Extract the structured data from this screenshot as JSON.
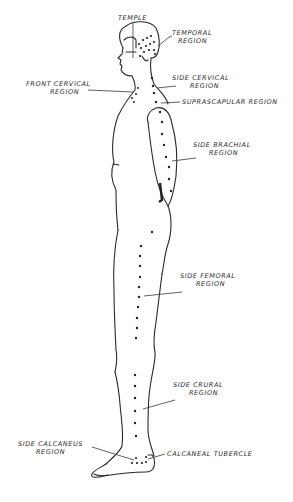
{
  "diagram": {
    "type": "anatomical side-view figure",
    "labels": {
      "temple": {
        "line1": "Temple",
        "line2": ""
      },
      "temporal": {
        "line1": "Temporal",
        "line2": "Region"
      },
      "front_cervical": {
        "line1": "Front Cervical",
        "line2": "Region"
      },
      "side_cervical": {
        "line1": "Side Cervical",
        "line2": "Region"
      },
      "suprascapular": {
        "line1": "Suprascapular Region",
        "line2": ""
      },
      "side_brachial": {
        "line1": "Side Brachial",
        "line2": "Region"
      },
      "side_femoral": {
        "line1": "Side Femoral",
        "line2": "Region"
      },
      "side_crural": {
        "line1": "Side Crural",
        "line2": "Region"
      },
      "side_calcaneus": {
        "line1": "Side Calcaneus",
        "line2": "Region"
      },
      "calcaneal_tubercle": {
        "line1": "Calcaneal Tubercle",
        "line2": ""
      }
    },
    "colors": {
      "ink": "#2a2a2a",
      "background": "#ffffff"
    }
  }
}
